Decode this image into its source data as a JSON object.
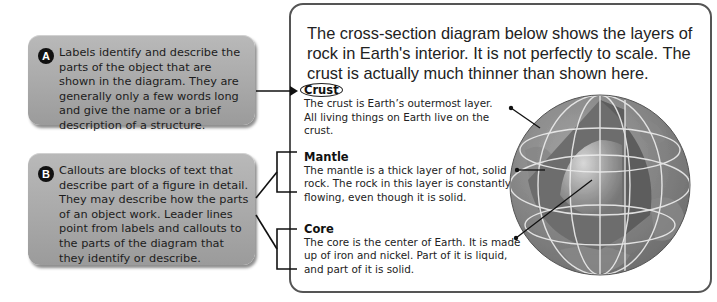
{
  "callout_a": {
    "badge": "A",
    "text": "Labels identify and describe the parts of the object that are shown in the diagram. They are generally only a few words long and give the name or a brief description of a structure."
  },
  "callout_b": {
    "badge": "B",
    "text": "Callouts are blocks of text that describe part of a figure in detail. They may describe how the parts of an object work. Leader lines point from labels and callouts to the parts of the diagram that they identify or describe."
  },
  "panel": {
    "intro": "The cross-section diagram below shows the layers of rock in Earth's interior. It is not perfectly to scale. The crust is actually much thinner than shown here.",
    "layers": [
      {
        "title": "Crust",
        "description": "The crust is Earth’s outermost layer. All living things on Earth live on the crust."
      },
      {
        "title": "Mantle",
        "description": "The mantle is a thick layer of hot, solid rock. The rock in this layer is constantly flowing, even though it is solid."
      },
      {
        "title": "Core",
        "description": "The core is the center of Earth. It is made up of iron and nickel. Part of it is liquid, and part of it is solid."
      }
    ],
    "image": "earth-cross-section-globe"
  },
  "colors": {
    "box_gray": "#a9a9a9",
    "badge": "#111111",
    "border": "#555555",
    "text": "#222222"
  }
}
